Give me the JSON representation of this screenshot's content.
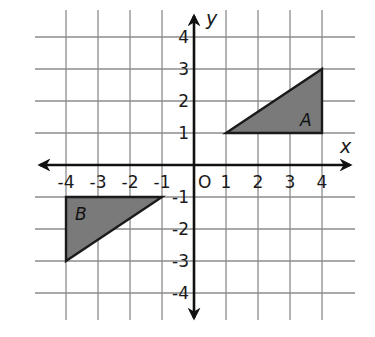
{
  "diagram": {
    "type": "coordinate-plane",
    "x_range": [
      -4,
      4
    ],
    "y_range": [
      -4,
      4
    ],
    "grid": true,
    "axis_labels": {
      "x": "x",
      "y": "y"
    },
    "origin_label": "O",
    "x_ticks": [
      {
        "value": -4,
        "label": "-4"
      },
      {
        "value": -3,
        "label": "-3"
      },
      {
        "value": -2,
        "label": "-2"
      },
      {
        "value": -1,
        "label": "-1"
      },
      {
        "value": 1,
        "label": "1"
      },
      {
        "value": 2,
        "label": "2"
      },
      {
        "value": 3,
        "label": "3"
      },
      {
        "value": 4,
        "label": "4"
      }
    ],
    "y_ticks": [
      {
        "value": 4,
        "label": "4"
      },
      {
        "value": 3,
        "label": "3"
      },
      {
        "value": 2,
        "label": "2"
      },
      {
        "value": 1,
        "label": "1"
      },
      {
        "value": -1,
        "label": "-1"
      },
      {
        "value": -2,
        "label": "-2"
      },
      {
        "value": -3,
        "label": "-3"
      },
      {
        "value": -4,
        "label": "-4"
      }
    ],
    "shapes": [
      {
        "label": "A",
        "vertices": [
          [
            1,
            1
          ],
          [
            4,
            1
          ],
          [
            4,
            3
          ]
        ],
        "fill": "#7a7a7a"
      },
      {
        "label": "B",
        "vertices": [
          [
            -4,
            -1
          ],
          [
            -1,
            -1
          ],
          [
            -4,
            -3
          ]
        ],
        "fill": "#7a7a7a"
      }
    ],
    "colors": {
      "grid": "#8c8c8c",
      "axes": "#111111",
      "shape_fill": "#7a7a7a",
      "background": "#ffffff"
    }
  }
}
